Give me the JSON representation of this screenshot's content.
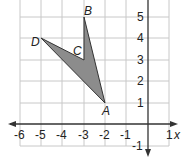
{
  "diagram": {
    "type": "coordinate-plane-polygon",
    "x_axis_label": "x",
    "x_ticks": [
      "-6",
      "-5",
      "-4",
      "-3",
      "-2",
      "-1",
      "1"
    ],
    "y_ticks": [
      "5",
      "4",
      "3",
      "2",
      "1",
      "-1"
    ],
    "x_range": [
      -6,
      1
    ],
    "y_range": [
      -1,
      5
    ],
    "vertices": [
      {
        "name": "A",
        "x": -2,
        "y": 1
      },
      {
        "name": "B",
        "x": -3,
        "y": 5
      },
      {
        "name": "C",
        "x": -3,
        "y": 3
      },
      {
        "name": "D",
        "x": -5,
        "y": 4
      }
    ],
    "fill_color": "#8c8c8c",
    "grid_color": "#c8c8c8",
    "axis_color": "#333333"
  }
}
